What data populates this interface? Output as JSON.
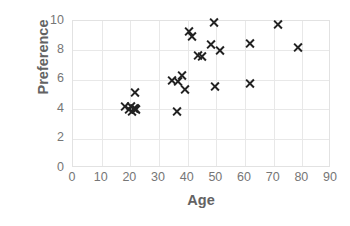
{
  "chart_data": {
    "type": "scatter",
    "title": "",
    "xlabel": "Age",
    "ylabel": "Preference",
    "xlim": [
      0,
      90
    ],
    "ylim": [
      0,
      10
    ],
    "xticks": [
      0,
      10,
      20,
      30,
      40,
      50,
      60,
      70,
      80,
      90
    ],
    "yticks": [
      0,
      2,
      4,
      6,
      8,
      10
    ],
    "grid": true,
    "legend": null,
    "marker": "x",
    "marker_color": "#222222",
    "axis_label_color": "#636363",
    "tick_label_color": "#767676",
    "gridline_color": "#e8e8e8",
    "series": [
      {
        "name": "observations",
        "points": [
          [
            18.5,
            4.1
          ],
          [
            20.0,
            3.9
          ],
          [
            20.5,
            4.1
          ],
          [
            21.0,
            3.8
          ],
          [
            21.5,
            4.0
          ],
          [
            22.0,
            4.0
          ],
          [
            22.0,
            5.1
          ],
          [
            22.5,
            3.9
          ],
          [
            35.0,
            5.9
          ],
          [
            36.5,
            3.8
          ],
          [
            37.0,
            5.8
          ],
          [
            38.5,
            6.2
          ],
          [
            39.5,
            5.3
          ],
          [
            41.0,
            9.2
          ],
          [
            42.0,
            8.9
          ],
          [
            44.0,
            7.6
          ],
          [
            45.5,
            7.5
          ],
          [
            48.5,
            8.3
          ],
          [
            49.5,
            9.8
          ],
          [
            50.0,
            5.5
          ],
          [
            51.5,
            7.9
          ],
          [
            62.0,
            8.4
          ],
          [
            62.0,
            5.7
          ],
          [
            72.0,
            9.7
          ],
          [
            79.0,
            8.1
          ]
        ]
      }
    ]
  }
}
